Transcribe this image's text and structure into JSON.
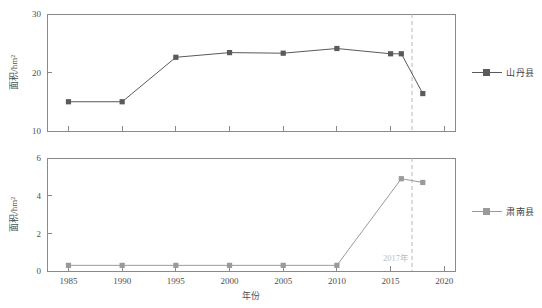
{
  "figure": {
    "background": "#ffffff",
    "annotation": {
      "text": "2017年",
      "year": 2017,
      "color": "#bdbdbd"
    }
  },
  "legend": {
    "top": {
      "label": "山丹县",
      "color": "#5a5a5a",
      "marker": "filled-square"
    },
    "bottom": {
      "label": "肃南县",
      "color": "#9a9a9a",
      "marker": "filled-square"
    }
  },
  "chart_data": [
    {
      "type": "line",
      "panel": "top",
      "title": "",
      "xlabel": "",
      "ylabel": "面积/hm²",
      "series_name": "山丹县",
      "color": "#5a5a5a",
      "marker": "square",
      "x": [
        1985,
        1990,
        1995,
        2000,
        2005,
        2010,
        2015,
        2016,
        2018
      ],
      "values": [
        15.0,
        15.0,
        22.6,
        23.4,
        23.3,
        24.1,
        23.2,
        23.2,
        16.4
      ],
      "categories": [
        "1985",
        "1990",
        "1995",
        "2000",
        "2005",
        "2010",
        "2015",
        "2016",
        "2018"
      ],
      "xlim": [
        1983,
        2021
      ],
      "ylim": [
        10,
        30
      ],
      "yticks": [
        10,
        20,
        30
      ],
      "xticks": [
        1985,
        1990,
        1995,
        2000,
        2005,
        2010,
        2015,
        2020
      ],
      "xticklabels": [
        "1985",
        "1990",
        "1995",
        "2000",
        "2005",
        "2010",
        "2015",
        "2020"
      ],
      "yticklabels": [
        "10",
        "20",
        "30"
      ],
      "grid": false,
      "legend_position": "right",
      "vline": 2017
    },
    {
      "type": "line",
      "panel": "bottom",
      "title": "",
      "xlabel": "年份",
      "ylabel": "面积/hm²",
      "series_name": "肃南县",
      "color": "#9a9a9a",
      "marker": "square",
      "x": [
        1985,
        1990,
        1995,
        2000,
        2005,
        2010,
        2016,
        2018
      ],
      "values": [
        0.3,
        0.3,
        0.3,
        0.3,
        0.3,
        0.3,
        4.9,
        4.7
      ],
      "categories": [
        "1985",
        "1990",
        "1995",
        "2000",
        "2005",
        "2010",
        "2016",
        "2018"
      ],
      "xlim": [
        1983,
        2021
      ],
      "ylim": [
        0,
        6
      ],
      "yticks": [
        0,
        2,
        4,
        6
      ],
      "xticks": [
        1985,
        1990,
        1995,
        2000,
        2005,
        2010,
        2015,
        2020
      ],
      "xticklabels": [
        "1985",
        "1990",
        "1995",
        "2000",
        "2005",
        "2010",
        "2015",
        "2020"
      ],
      "yticklabels": [
        "0",
        "2",
        "4",
        "6"
      ],
      "grid": false,
      "legend_position": "right",
      "vline": 2017
    }
  ]
}
